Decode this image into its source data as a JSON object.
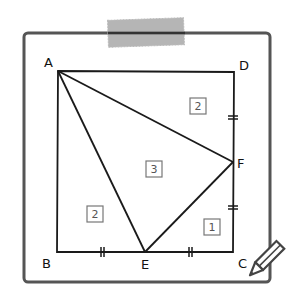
{
  "figure": {
    "type": "geometry-diagram",
    "colors": {
      "stroke": "#1a1a1a",
      "frame": "#555555",
      "tape": "#9a9a9a",
      "box": "#777777"
    }
  },
  "points": {
    "A": {
      "label": "A",
      "x": 58,
      "y": 71
    },
    "B": {
      "label": "B",
      "x": 57,
      "y": 252
    },
    "C": {
      "label": "C",
      "x": 233,
      "y": 252
    },
    "D": {
      "label": "D",
      "x": 234,
      "y": 72
    },
    "E": {
      "label": "E",
      "x": 145,
      "y": 252
    },
    "F": {
      "label": "F",
      "x": 233,
      "y": 162
    }
  },
  "segments": [
    [
      "A",
      "D"
    ],
    [
      "D",
      "C"
    ],
    [
      "C",
      "B"
    ],
    [
      "B",
      "A"
    ],
    [
      "A",
      "E"
    ],
    [
      "A",
      "F"
    ],
    [
      "E",
      "F"
    ]
  ],
  "equal_marks": [
    {
      "segment": "BE",
      "x": 102,
      "y": 252,
      "orientation": "vertical"
    },
    {
      "segment": "EC",
      "x": 190,
      "y": 252,
      "orientation": "vertical"
    },
    {
      "segment": "DF",
      "x": 233,
      "y": 117,
      "orientation": "horizontal"
    },
    {
      "segment": "FC",
      "x": 233,
      "y": 207,
      "orientation": "horizontal"
    }
  ],
  "regions": [
    {
      "name": "triangle-ADF",
      "value": "2",
      "x": 198,
      "y": 106
    },
    {
      "name": "triangle-AEF",
      "value": "3",
      "x": 154,
      "y": 168
    },
    {
      "name": "triangle-ABE",
      "value": "2",
      "x": 95,
      "y": 213
    },
    {
      "name": "triangle-ECF",
      "value": "1",
      "x": 211,
      "y": 227
    }
  ]
}
